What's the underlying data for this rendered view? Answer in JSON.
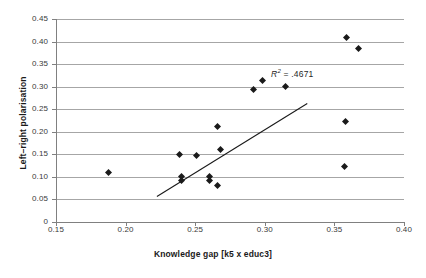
{
  "chart_data": {
    "type": "scatter",
    "title": "",
    "xlabel": "Knowledge gap [k5 x educ3]",
    "ylabel": "Left–right polarisation",
    "xlim": [
      0.15,
      0.4
    ],
    "ylim": [
      0.0,
      0.45
    ],
    "xticks": [
      "0.15",
      "0.20",
      "0.25",
      "0.30",
      "0.35",
      "0.40"
    ],
    "xtick_values": [
      0.15,
      0.2,
      0.25,
      0.3,
      0.35,
      0.4
    ],
    "yticks": [
      "0",
      "0.05",
      "0.10",
      "0.15",
      "0.20",
      "0.25",
      "0.30",
      "0.35",
      "0.40",
      "0.45"
    ],
    "ytick_values": [
      0,
      0.05,
      0.1,
      0.15,
      0.2,
      0.25,
      0.3,
      0.35,
      0.4,
      0.45
    ],
    "grid": "horizontal",
    "legend": "none",
    "marker": "diamond",
    "marker_color": "#1a1a1a",
    "gridline_color": "#a6a6a6",
    "axis_color": "#808080",
    "trendline_color": "#1a1a1a",
    "points": [
      {
        "x": 0.188,
        "y": 0.11
      },
      {
        "x": 0.239,
        "y": 0.15
      },
      {
        "x": 0.24,
        "y": 0.1
      },
      {
        "x": 0.24,
        "y": 0.093
      },
      {
        "x": 0.251,
        "y": 0.148
      },
      {
        "x": 0.26,
        "y": 0.1
      },
      {
        "x": 0.26,
        "y": 0.093
      },
      {
        "x": 0.266,
        "y": 0.081
      },
      {
        "x": 0.266,
        "y": 0.212
      },
      {
        "x": 0.268,
        "y": 0.16
      },
      {
        "x": 0.292,
        "y": 0.293
      },
      {
        "x": 0.298,
        "y": 0.313
      },
      {
        "x": 0.315,
        "y": 0.3
      },
      {
        "x": 0.357,
        "y": 0.122
      },
      {
        "x": 0.358,
        "y": 0.222
      },
      {
        "x": 0.359,
        "y": 0.41
      },
      {
        "x": 0.367,
        "y": 0.385
      }
    ],
    "trendline": {
      "x0": 0.2225,
      "y0": 0.0565,
      "x1": 0.3305,
      "y1": 0.2625
    },
    "annotations": [
      {
        "name": "r-squared",
        "text_prefix": "R",
        "text_sup": "2",
        "text_suffix": " = .4671",
        "full_text": "R2 = .4671",
        "x": 0.3045,
        "y": 0.327
      }
    ]
  }
}
